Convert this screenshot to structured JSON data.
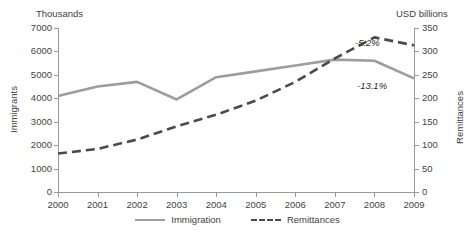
{
  "axes": {
    "left_unit_label": "Thousands",
    "right_unit_label": "USD billions",
    "left_title": "Immigrants",
    "right_title": "Remittances"
  },
  "annotations": {
    "remittances_change": "-5.2%",
    "immigration_change": "-13.1%"
  },
  "legend": {
    "items": [
      {
        "label": "Immigration",
        "style": "solid",
        "color": "#9d9d9d"
      },
      {
        "label": "Remittances",
        "style": "dashed",
        "color": "#4a4a4a"
      }
    ]
  },
  "chart_data": {
    "type": "line",
    "title": "",
    "subtitle": "",
    "xlabel": "",
    "ylabel": "Immigrants",
    "y2label": "Remittances",
    "grid": false,
    "legend_position": "bottom-center",
    "categories": [
      "2000",
      "2001",
      "2002",
      "2003",
      "2004",
      "2005",
      "2006",
      "2007",
      "2008",
      "2009"
    ],
    "left_axis": {
      "unit": "Thousands",
      "name": "Immigrants",
      "ylim": [
        0,
        7000
      ],
      "ticks": [
        0,
        1000,
        2000,
        3000,
        4000,
        5000,
        6000,
        7000
      ],
      "tick_labels": [
        "0",
        "1000",
        "2000",
        "3000",
        "4000",
        "5000",
        "6000",
        "7000"
      ]
    },
    "right_axis": {
      "unit": "USD billions",
      "name": "Remittances",
      "ylim": [
        0,
        350
      ],
      "ticks": [
        0,
        50,
        100,
        150,
        200,
        250,
        300,
        350
      ],
      "tick_labels": [
        "0",
        "50",
        "100",
        "150",
        "200",
        "250",
        "300",
        "350"
      ]
    },
    "series": [
      {
        "name": "Immigration",
        "axis": "left",
        "style": "solid",
        "color": "#9d9d9d",
        "values": [
          4100,
          4500,
          4700,
          3950,
          4900,
          5150,
          5400,
          5650,
          5600,
          4850
        ],
        "annotation": "-13.1%"
      },
      {
        "name": "Remittances",
        "axis": "right",
        "style": "dashed",
        "color": "#4a4a4a",
        "values": [
          82,
          92,
          112,
          140,
          165,
          195,
          235,
          285,
          330,
          313
        ],
        "annotation": "-5.2%"
      }
    ]
  }
}
